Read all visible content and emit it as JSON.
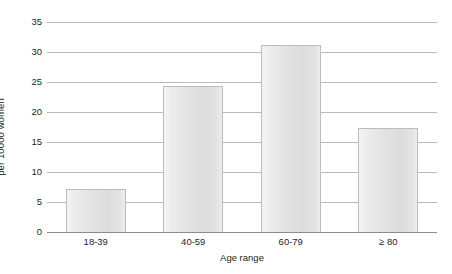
{
  "chart_data": {
    "type": "bar",
    "title": "",
    "xlabel": "Age range",
    "ylabel": "per 10000 women",
    "categories": [
      "18-39",
      "40-59",
      "60-79",
      "≥ 80"
    ],
    "values": [
      7.1,
      24.3,
      31.2,
      17.3
    ],
    "ylim": [
      0,
      35
    ],
    "ytick_labels": [
      "0",
      "5",
      "10",
      "15",
      "20",
      "25",
      "30",
      "35"
    ],
    "ytick_values": [
      0,
      5,
      10,
      15,
      20,
      25,
      30,
      35
    ],
    "grid": "horizontal",
    "legend": "none",
    "bar_fill_color": "#e3e3e3",
    "bar_border_color": "#bcbcbc",
    "gridline_color": "#b9b9b9",
    "axis_color": "#8c8c8c",
    "text_color": "#231f20",
    "background_color": "#ffffff"
  }
}
